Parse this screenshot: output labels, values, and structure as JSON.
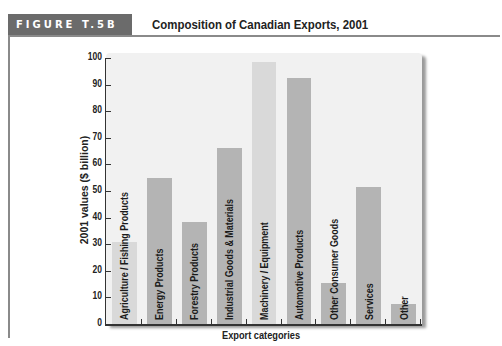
{
  "figure": {
    "label": "FIGURE T.5B",
    "title": "Composition of Canadian Exports, 2001"
  },
  "colors": {
    "header_bg": "#6b6b6b",
    "panel_bg": "#f1f1f1",
    "bar_dark": "#b4b4b4",
    "bar_light": "#d9d9d9"
  },
  "chart_data": {
    "type": "bar",
    "title": "Composition of Canadian Exports, 2001",
    "xlabel": "Export categories",
    "ylabel": "2001 values ($ billion)",
    "ylim": [
      0,
      100
    ],
    "yticks": [
      0,
      10,
      20,
      30,
      40,
      50,
      60,
      70,
      80,
      90,
      100
    ],
    "grid": false,
    "legend": null,
    "categories": [
      "Agriculture / Fishing Products",
      "Energy Products",
      "Forestry Products",
      "Industrial Goods & Materials",
      "Machinery / Equipment",
      "Automotive Products",
      "Other Consumer Goods",
      "Services",
      "Other"
    ],
    "values": [
      31,
      55,
      38.5,
      66,
      98.5,
      92.5,
      15.5,
      51.5,
      7.5
    ],
    "bar_shades": [
      "light",
      "dark",
      "dark",
      "dark",
      "light",
      "dark",
      "dark",
      "dark",
      "dark"
    ]
  }
}
